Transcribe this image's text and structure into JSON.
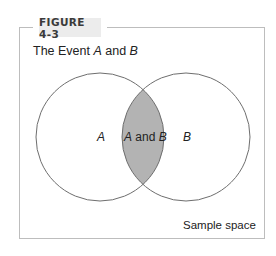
{
  "figure": {
    "label": "FIGURE 4-3",
    "title_prefix": "The Event ",
    "title_a": "A",
    "title_mid": " and ",
    "title_b": "B"
  },
  "venn": {
    "set_a_label": "A",
    "set_b_label": "B",
    "intersection": {
      "label_a": "A",
      "label_mid": " and ",
      "label_b": "B"
    },
    "sample_space_label": "Sample space",
    "colors": {
      "intersection_fill": "#b3b3b3",
      "circle_stroke": "#6e6e6e",
      "frame_stroke": "#bdbdbd",
      "label_bg": "#ececec"
    }
  }
}
